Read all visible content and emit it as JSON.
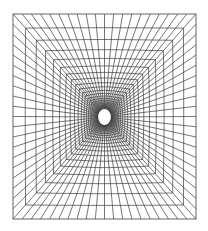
{
  "figure": {
    "description": "Structured quadrilateral mesh around a circular hole in a square domain",
    "canvas": {
      "width": 208,
      "height": 231,
      "background": "#ffffff"
    },
    "outer_boundary": {
      "x0": 13,
      "y0": 14,
      "x1": 196,
      "y1": 219
    },
    "hole": {
      "cx": 104.5,
      "cy": 117,
      "rx": 7,
      "ry": 8.5,
      "fill": "#ffffff"
    },
    "radial_lines_per_side": 20,
    "ring_count": 22,
    "ring_growth_ratio": 0.86,
    "line_color": "#3a3a3a",
    "line_width": 0.7,
    "boundary_color": "#555555",
    "boundary_width": 0.9
  }
}
